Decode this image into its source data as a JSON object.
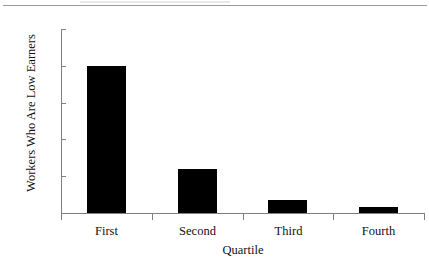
{
  "chart_data": {
    "type": "bar",
    "title": "",
    "categories": [
      "First",
      "Second",
      "Third",
      "Fourth"
    ],
    "values": [
      0.2,
      0.06,
      0.018,
      0.008
    ],
    "xlabel": "Quartile",
    "ylabel": "Workers Who Are Low Earners",
    "ylim": [
      0,
      0.25
    ],
    "yticks": [
      "0",
      "0.05",
      "0.1",
      "0.15",
      "0.2",
      "0.25"
    ],
    "ytick_values": [
      0,
      0.05,
      0.1,
      0.15,
      0.2,
      0.25
    ],
    "grid": false,
    "legend": false,
    "bar_color": "#000000",
    "axis_color": "#808080",
    "text_color": "#111111",
    "background": "#ffffff"
  }
}
